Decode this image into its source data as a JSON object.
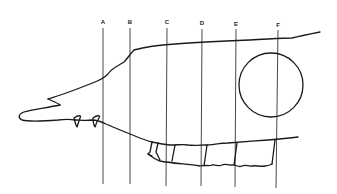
{
  "diagram": {
    "type": "anatomical-outline",
    "section_labels": [
      "A",
      "B",
      "C",
      "D",
      "E",
      "F"
    ],
    "section_lines": [
      {
        "label": "A",
        "x": 103
      },
      {
        "label": "B",
        "x": 130
      },
      {
        "label": "C",
        "x": 167
      },
      {
        "label": "D",
        "x": 202
      },
      {
        "label": "E",
        "x": 236
      },
      {
        "label": "F",
        "x": 278
      }
    ],
    "colors": {
      "background": "#ffffff",
      "stroke": "#1a1a1a"
    }
  }
}
